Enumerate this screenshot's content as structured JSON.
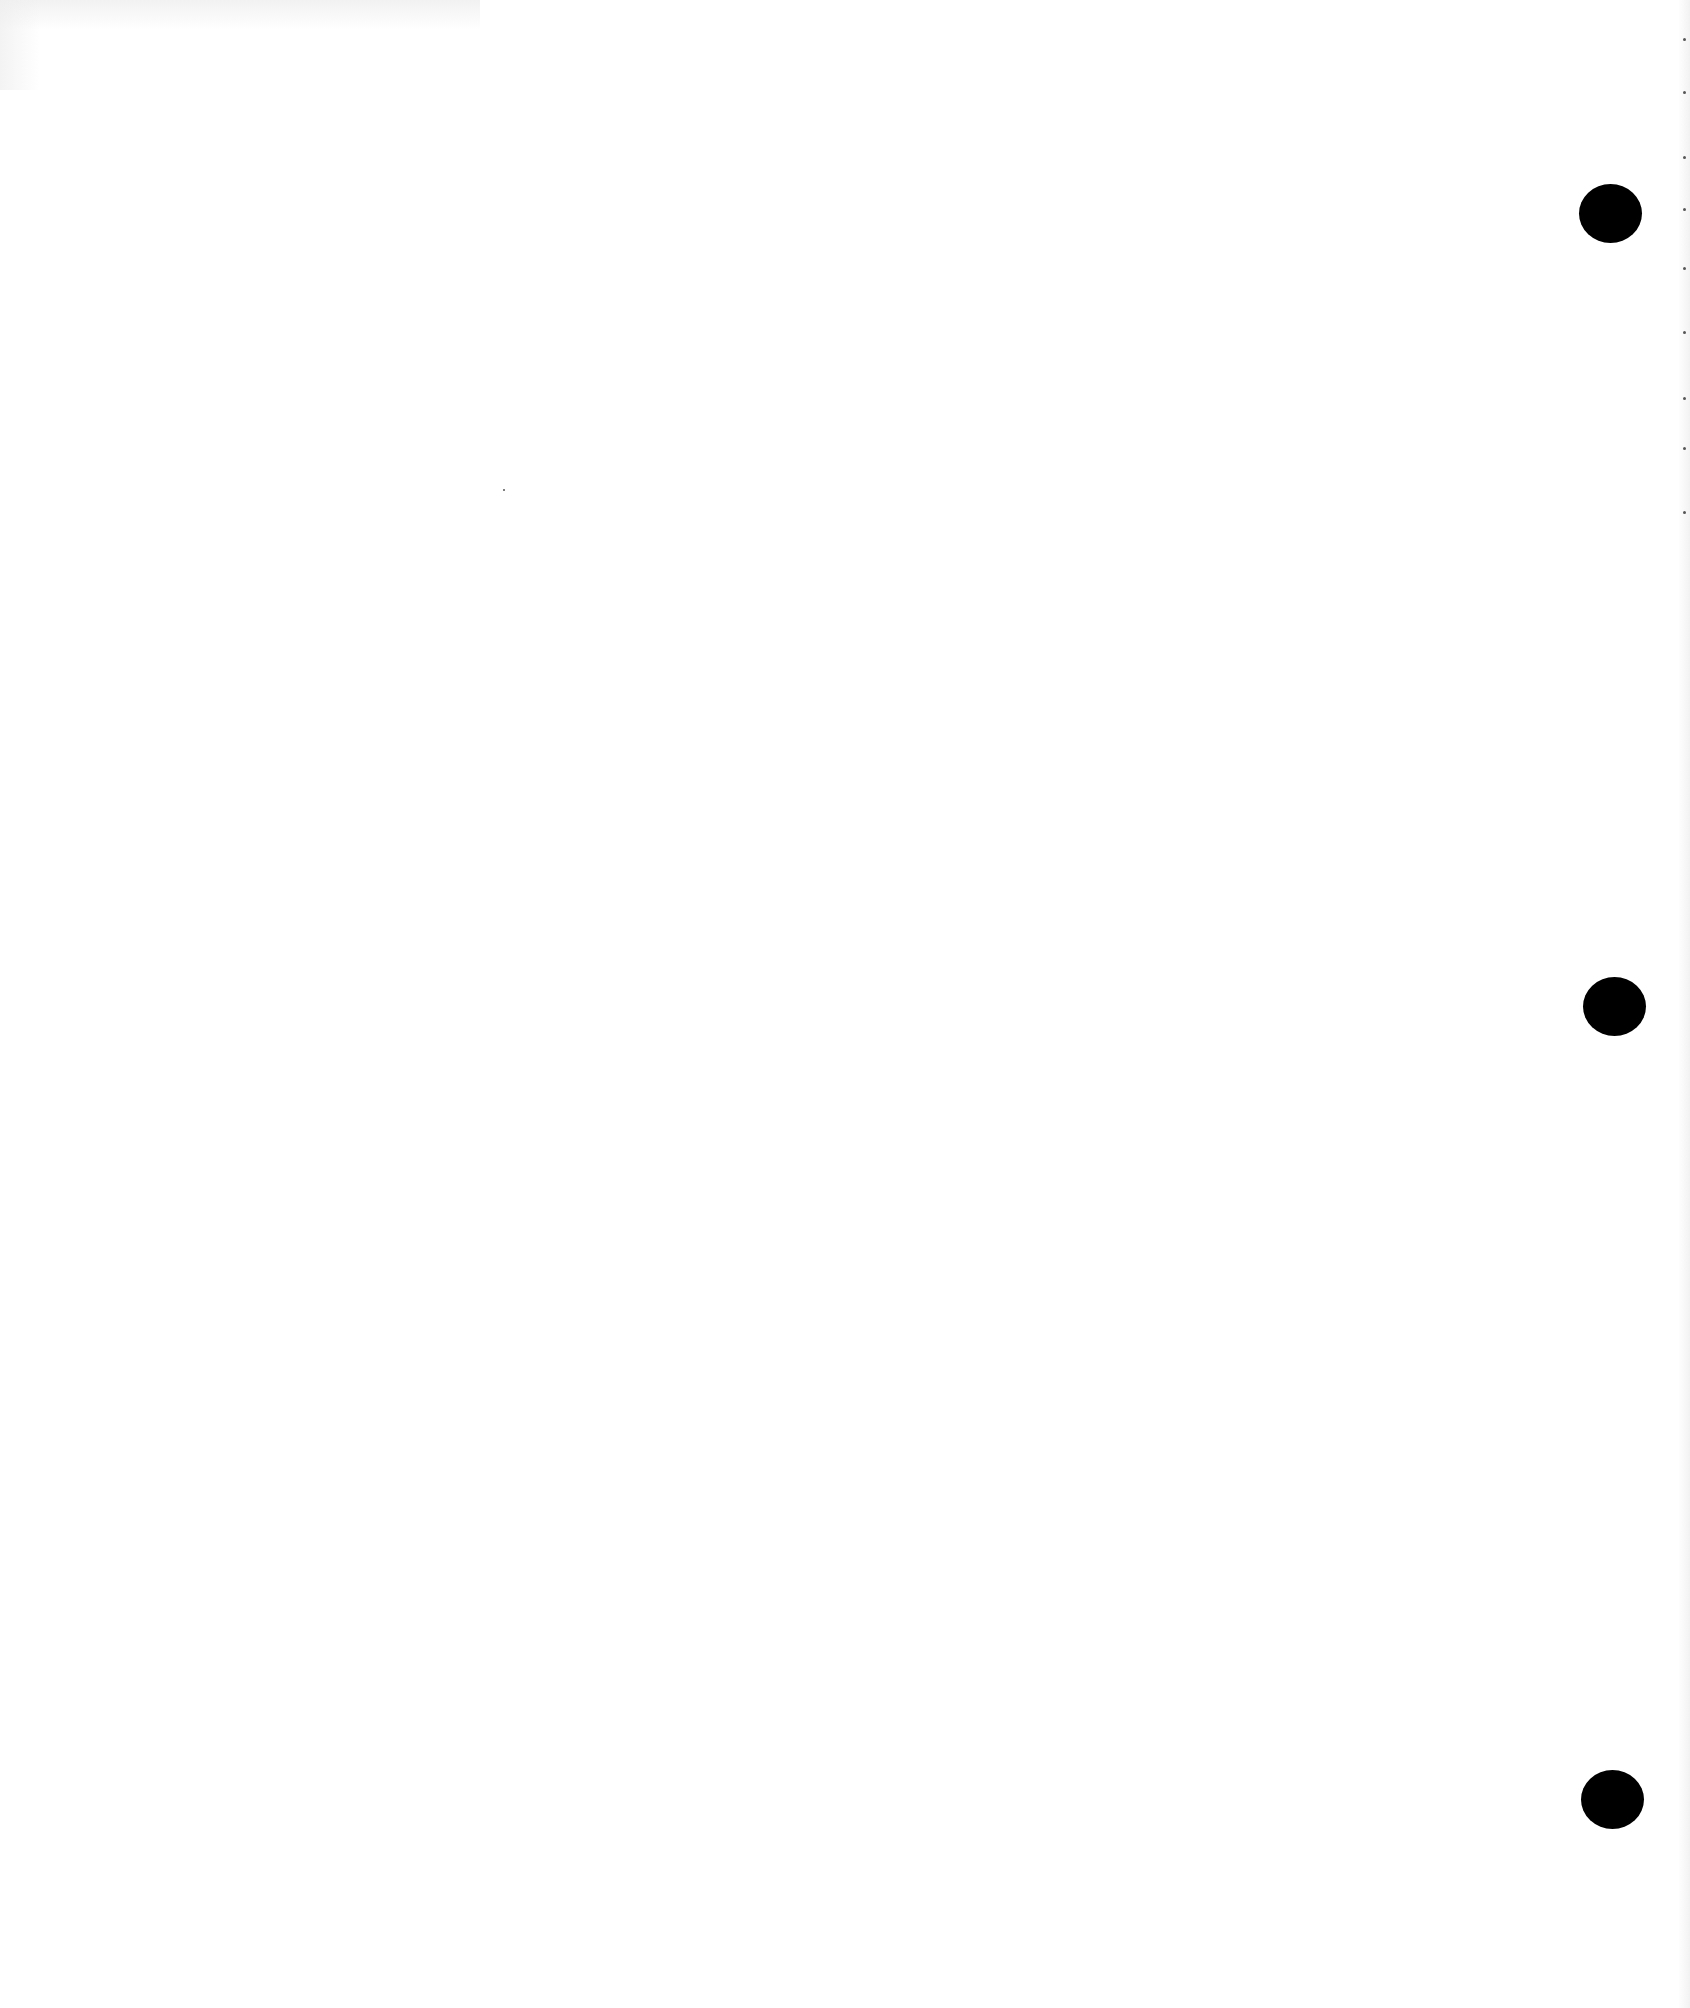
{
  "document": {
    "type": "blank-scanned-page",
    "background_color": "#ffffff",
    "punch_holes": [
      {
        "label": "top",
        "cx": 1610,
        "cy": 213,
        "color": "#000000"
      },
      {
        "label": "middle",
        "cx": 1614,
        "cy": 1006,
        "color": "#000000"
      },
      {
        "label": "bottom",
        "cx": 1612,
        "cy": 1799,
        "color": "#000000"
      }
    ],
    "edge_marks_y": [
      38,
      91,
      156,
      208,
      267,
      331,
      397,
      447,
      511
    ]
  }
}
